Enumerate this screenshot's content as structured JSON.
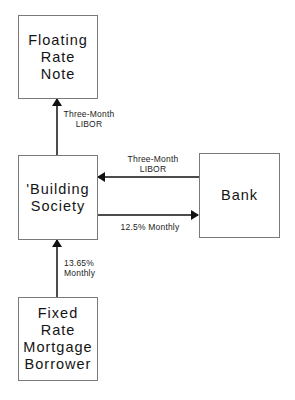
{
  "diagram": {
    "nodes": [
      {
        "id": "floating-rate-note",
        "label": "Floating\nRate\nNote"
      },
      {
        "id": "building-society",
        "label": "'Building\nSociety"
      },
      {
        "id": "bank",
        "label": "Bank"
      },
      {
        "id": "fixed-rate-mortgage-borrower",
        "label": "Fixed Rate\nMortgage\nBorrower"
      }
    ],
    "edges": [
      {
        "from": "building-society",
        "to": "floating-rate-note",
        "label": "Three-Month\nLIBOR"
      },
      {
        "from": "bank",
        "to": "building-society",
        "label": "Three-Month\nLIBOR"
      },
      {
        "from": "building-society",
        "to": "bank",
        "label": "12.5% Monthly"
      },
      {
        "from": "fixed-rate-mortgage-borrower",
        "to": "building-society",
        "label": "13.65%\nMonthly"
      }
    ]
  },
  "colors": {
    "box_border": "#7a7a7a",
    "arrow": "#111111",
    "background": "#ffffff"
  }
}
